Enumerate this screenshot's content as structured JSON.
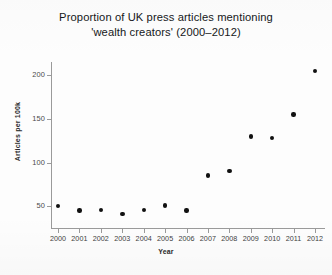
{
  "chart_data": {
    "type": "scatter",
    "title": "Proportion of UK press articles mentioning 'wealth creators' (2000–2012)",
    "title_lines": [
      "Proportion of UK press articles mentioning",
      "'wealth creators' (2000–2012)"
    ],
    "xlabel": "Year",
    "ylabel": "Articles per 100k",
    "categories": [
      2000,
      2001,
      2002,
      2003,
      2004,
      2005,
      2006,
      2007,
      2008,
      2009,
      2010,
      2011,
      2012
    ],
    "x_tick_labels": [
      "2000",
      "2001",
      "2002",
      "2003",
      "2004",
      "2005",
      "2006",
      "2007",
      "2008",
      "2009",
      "2010",
      "2011",
      "2012"
    ],
    "values": [
      50,
      45,
      46,
      41,
      46,
      51,
      45,
      85,
      90,
      130,
      128,
      155,
      205
    ],
    "y_tick_labels": [
      "200",
      "150",
      "100",
      "50"
    ],
    "y_ticks": [
      200,
      150,
      100,
      50
    ],
    "xlim": [
      2000,
      2012
    ],
    "ylim": [
      25,
      215
    ],
    "grid": false,
    "legend": false,
    "marker": "filled-circle",
    "marker_color": "#111111",
    "axis_color": "#9a9a9a",
    "series": [
      {
        "name": "Articles per 100k",
        "points": [
          {
            "x": 2000,
            "y": 50
          },
          {
            "x": 2001,
            "y": 45
          },
          {
            "x": 2002,
            "y": 46
          },
          {
            "x": 2003,
            "y": 41
          },
          {
            "x": 2004,
            "y": 46
          },
          {
            "x": 2005,
            "y": 51
          },
          {
            "x": 2006,
            "y": 45
          },
          {
            "x": 2007,
            "y": 85
          },
          {
            "x": 2008,
            "y": 90
          },
          {
            "x": 2009,
            "y": 130
          },
          {
            "x": 2010,
            "y": 128
          },
          {
            "x": 2011,
            "y": 155
          },
          {
            "x": 2012,
            "y": 205
          }
        ]
      }
    ]
  }
}
